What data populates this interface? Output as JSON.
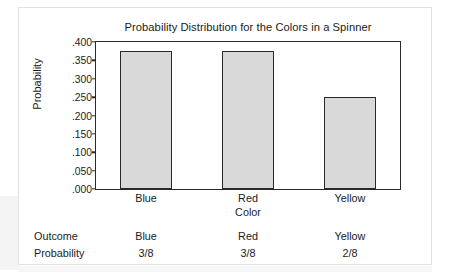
{
  "chart_data": {
    "type": "bar",
    "title": "Probability Distribution for the Colors in a Spinner",
    "xlabel": "Color",
    "ylabel": "Probability",
    "categories": [
      "Blue",
      "Red",
      "Yellow"
    ],
    "values": [
      0.375,
      0.375,
      0.25
    ],
    "ylim": [
      0.0,
      0.4
    ],
    "ytick_labels": [
      ".400",
      ".350",
      ".300",
      ".250",
      ".200",
      ".150",
      ".100",
      ".050",
      ".000"
    ],
    "ytick_values": [
      0.4,
      0.35,
      0.3,
      0.25,
      0.2,
      0.15,
      0.1,
      0.05,
      0.0
    ],
    "grid": false,
    "legend": false,
    "bar_fill_color": "#d9d9d9",
    "bar_border_color": "#2a2a2a",
    "axis_color": "#2a2a2a",
    "text_color": "#1b1b1b"
  },
  "table": {
    "rows": [
      {
        "header": "Outcome",
        "cells": [
          "Blue",
          "Red",
          "Yellow"
        ]
      },
      {
        "header": "Probability",
        "cells": [
          "3/8",
          "3/8",
          "2/8"
        ]
      }
    ]
  }
}
